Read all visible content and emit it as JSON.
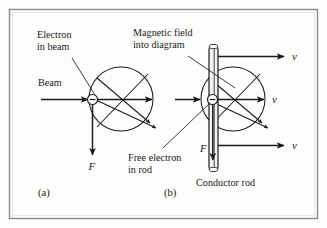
{
  "figure": {
    "caption_labels": {
      "panel_a": "(a)",
      "panel_b": "(b)"
    },
    "colors": {
      "line": "#1b1b1b",
      "border": "#8a8a8a",
      "background": "#fdfdfb",
      "rod_fill": "#f2f2f0"
    },
    "panel_a": {
      "label_electron_in_beam_line1": "Electron",
      "label_electron_in_beam_line2": "in beam",
      "label_beam": "Beam",
      "label_force": "F",
      "label_panel": "(a)",
      "electron_charge_sign": "minus-sign",
      "field_direction": "into-page"
    },
    "panel_b": {
      "label_magnetic_field_line1": "Magnetic field",
      "label_magnetic_field_line2": "into diagram",
      "label_free_electron_line1": "Free electron",
      "label_free_electron_line2": "in rod",
      "label_conductor_rod": "Conductor rod",
      "label_force": "F",
      "label_velocity_top": "v",
      "label_velocity_middle": "v",
      "label_velocity_bottom": "v",
      "label_panel": "(b)",
      "electron_charge_sign": "minus-sign",
      "field_direction": "into-page"
    }
  }
}
